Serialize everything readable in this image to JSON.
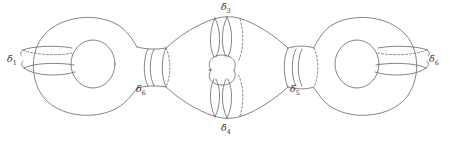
{
  "figure": {
    "type": "topological-surface-diagram",
    "background_color": "#ffffff",
    "stroke_color": "#6e6e6e",
    "label_color": "#2b2b2b",
    "dash_pattern": "2,2",
    "width": 450,
    "height": 141
  },
  "labels": [
    {
      "id": "d1",
      "symbol": "δ",
      "subscript": "1",
      "x": 9,
      "y": 57,
      "anchor": "left-handle-curve"
    },
    {
      "id": "d2",
      "symbol": "δ",
      "subscript": "6",
      "x": 137,
      "y": 87,
      "anchor": "left-neck-curve"
    },
    {
      "id": "d3",
      "symbol": "δ",
      "subscript": "3",
      "x": 222,
      "y": 3,
      "anchor": "top-center-curve"
    },
    {
      "id": "d4",
      "symbol": "δ",
      "subscript": "4",
      "x": 222,
      "y": 122,
      "anchor": "bottom-center-curve"
    },
    {
      "id": "d5",
      "symbol": "δ",
      "subscript": "5",
      "x": 291,
      "y": 87,
      "anchor": "right-neck-curve"
    },
    {
      "id": "d6",
      "symbol": "δ",
      "subscript": "6",
      "x": 428,
      "y": 57,
      "anchor": "right-handle-curve"
    }
  ],
  "components": {
    "left_torus": "outer torus with handle hole",
    "right_torus": "outer torus with handle hole",
    "left_neck": "cylindrical neck joining left torus to central piece",
    "right_neck": "cylindrical neck joining central piece to right torus",
    "center_piece": "central lens-shaped body with inner handle hole"
  }
}
